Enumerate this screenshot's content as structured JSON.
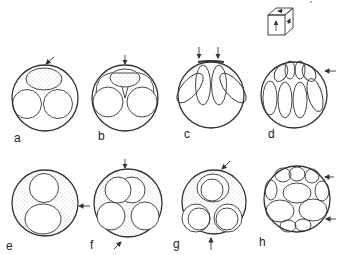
{
  "figure": {
    "panels": [
      {
        "id": "a",
        "label": "a",
        "description": "Stippled ellipse on top, two clear circles below; arrow from upper right"
      },
      {
        "id": "b",
        "label": "b",
        "description": "Stippled ellipse compressed between two circles; vertical arrow from top"
      },
      {
        "id": "c",
        "label": "c",
        "description": "Four elongated ellipses hanging from top; two vertical arrows from top"
      },
      {
        "id": "d",
        "label": "d",
        "description": "Two rows of elongated ellipses packed against top; arrow from right"
      },
      {
        "id": "e",
        "label": "e",
        "description": "Stippled sphere with two stacked circles; arrow from right"
      },
      {
        "id": "f",
        "label": "f",
        "description": "Stippled sphere with four circles; arrows from top and bottom-left"
      },
      {
        "id": "g",
        "label": "g",
        "description": "Stippled sphere with nested circles; arrows from top-right and bottom"
      },
      {
        "id": "h",
        "label": "h",
        "description": "Sphere packed with many ellipses; two arrows from right"
      }
    ],
    "orientation_cube": {
      "description": "Small cube with arrows on three faces"
    },
    "colors": {
      "stroke": "#333333",
      "stipple": "#9a9a9a",
      "background": "#ffffff"
    }
  }
}
